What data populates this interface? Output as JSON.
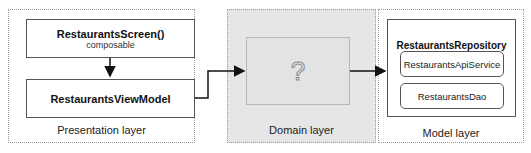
{
  "presentation_layer": {
    "label": "Presentation layer",
    "screen_title": "RestaurantsScreen()",
    "screen_subtitle": "composable",
    "viewmodel_title": "RestaurantsViewModel"
  },
  "domain_layer": {
    "label": "Domain layer",
    "placeholder": "?"
  },
  "model_layer": {
    "label": "Model layer",
    "repository_title": "RestaurantsRepository",
    "components": [
      "RestaurantsApiService",
      "RestaurantsDao"
    ]
  },
  "colors": {
    "domain_bg": "#e6e6e6",
    "arrow": "#111111"
  }
}
